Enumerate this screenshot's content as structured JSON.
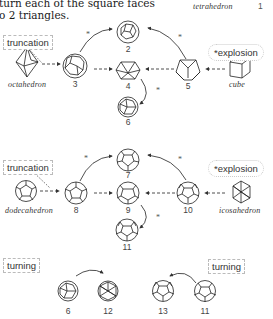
{
  "header_text": {
    "line1": "turn each of the square faces",
    "line2": "o 2 triangles.",
    "right_label": "tetrahedron",
    "right_number": "1"
  },
  "section1": {
    "tag_left": "truncation",
    "tag_right": "*explosion",
    "source_left": "octahedron",
    "source_right": "cube",
    "nodes": [
      "2",
      "3",
      "4",
      "5",
      "6"
    ],
    "star": "*"
  },
  "section2": {
    "tag_left": "truncation",
    "tag_right": "*explosion",
    "source_left": "dodecahedron",
    "source_right": "icosahedron",
    "nodes": [
      "7",
      "8",
      "9",
      "10",
      "11"
    ],
    "star": "*"
  },
  "section3": {
    "tag_left": "turning",
    "tag_right": "turning",
    "left_pair": [
      "6",
      "12"
    ],
    "right_pair": [
      "13",
      "11"
    ]
  },
  "colors": {
    "ink": "#222222",
    "arrow": "#555555",
    "tag_border": "#bbbbbb"
  }
}
